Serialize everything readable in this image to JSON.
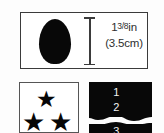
{
  "figure": {
    "background_color": "#fdfdfd",
    "ink_color": "#080808",
    "border_color": "#3b3b3b"
  },
  "top_panel": {
    "shape_name": "egg-oval-silhouette",
    "dimension": {
      "inches_whole": "1",
      "inches_fraction": "3/8",
      "inches_unit": "in",
      "metric": "(3.5cm)"
    }
  },
  "stars_panel": {
    "star_glyph": "★",
    "star_count": 3,
    "stars": [
      {
        "position": "top"
      },
      {
        "position": "bottom-left"
      },
      {
        "position": "bottom-right"
      }
    ]
  },
  "numbers_panel": {
    "background_color": "#080808",
    "text_color": "#f2f2f2",
    "items": [
      "1",
      "2",
      "3"
    ]
  }
}
